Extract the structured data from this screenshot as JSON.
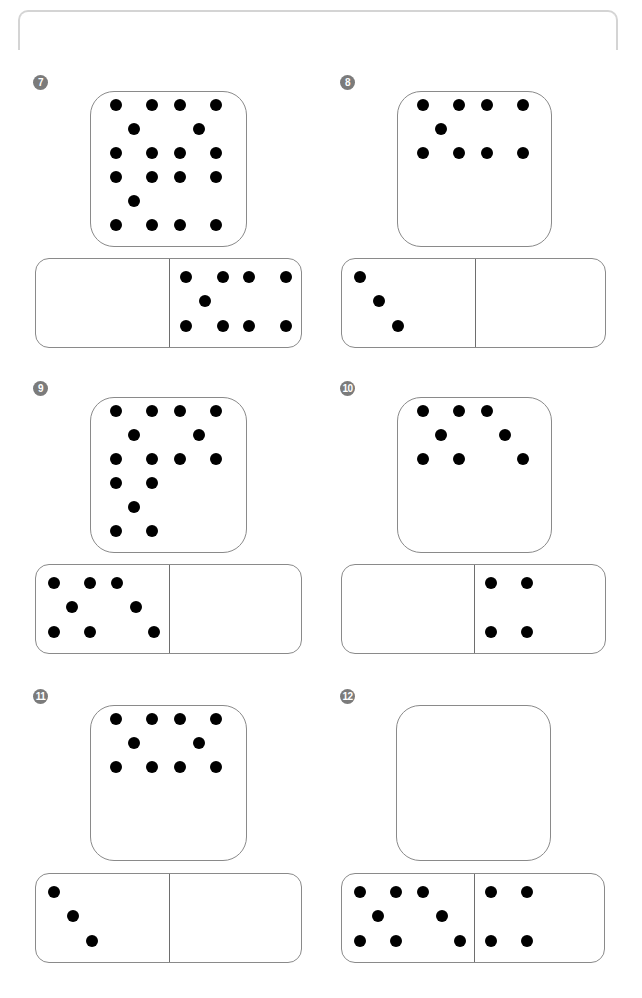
{
  "worksheet": {
    "frame_color": "#d4d4d4",
    "badge_color": "#7b7b7b",
    "dot_color": "#000000",
    "problems": [
      {
        "number": "7",
        "badge": {
          "x": 33,
          "y": 75
        },
        "square": {
          "x": 90,
          "y": 91,
          "w": 157,
          "h": 156,
          "dot_count": 19,
          "dots": [
            [
              25,
              13
            ],
            [
              61,
              13
            ],
            [
              89,
              13
            ],
            [
              125,
              13
            ],
            [
              43,
              37
            ],
            [
              108,
              37
            ],
            [
              25,
              61
            ],
            [
              61,
              61
            ],
            [
              89,
              61
            ],
            [
              125,
              61
            ],
            [
              25,
              85
            ],
            [
              61,
              85
            ],
            [
              89,
              85
            ],
            [
              125,
              85
            ],
            [
              43,
              109
            ],
            [
              25,
              133
            ],
            [
              61,
              133
            ],
            [
              89,
              133
            ],
            [
              125,
              133
            ]
          ]
        },
        "domino": {
          "x": 35,
          "y": 258,
          "w": 267,
          "h": 90,
          "divider_x": 133,
          "left_count": null,
          "right_count": 9,
          "dots": [
            [
              150,
              18
            ],
            [
              187,
              18
            ],
            [
              213,
              18
            ],
            [
              250,
              18
            ],
            [
              169,
              42
            ],
            [
              150,
              67
            ],
            [
              187,
              67
            ],
            [
              213,
              67
            ],
            [
              250,
              67
            ]
          ]
        }
      },
      {
        "number": "8",
        "badge": {
          "x": 340,
          "y": 75
        },
        "square": {
          "x": 397,
          "y": 91,
          "w": 155,
          "h": 156,
          "dot_count": 9,
          "dots": [
            [
              25,
              13
            ],
            [
              61,
              13
            ],
            [
              89,
              13
            ],
            [
              125,
              13
            ],
            [
              43,
              37
            ],
            [
              25,
              61
            ],
            [
              61,
              61
            ],
            [
              89,
              61
            ],
            [
              125,
              61
            ]
          ]
        },
        "domino": {
          "x": 341,
          "y": 258,
          "w": 265,
          "h": 90,
          "divider_x": 133,
          "left_count": 3,
          "right_count": null,
          "dots": [
            [
              18,
              18
            ],
            [
              37,
              42
            ],
            [
              56,
              67
            ]
          ]
        }
      },
      {
        "number": "9",
        "badge": {
          "x": 33,
          "y": 381
        },
        "square": {
          "x": 90,
          "y": 397,
          "w": 157,
          "h": 156,
          "dot_count": 15,
          "dots": [
            [
              25,
              13
            ],
            [
              61,
              13
            ],
            [
              89,
              13
            ],
            [
              125,
              13
            ],
            [
              43,
              37
            ],
            [
              108,
              37
            ],
            [
              25,
              61
            ],
            [
              61,
              61
            ],
            [
              89,
              61
            ],
            [
              125,
              61
            ],
            [
              25,
              85
            ],
            [
              61,
              85
            ],
            [
              43,
              109
            ],
            [
              25,
              133
            ],
            [
              61,
              133
            ]
          ]
        },
        "domino": {
          "x": 35,
          "y": 564,
          "w": 267,
          "h": 90,
          "divider_x": 133,
          "left_count": 8,
          "right_count": null,
          "dots": [
            [
              18,
              18
            ],
            [
              54,
              18
            ],
            [
              81,
              18
            ],
            [
              36,
              42
            ],
            [
              100,
              42
            ],
            [
              18,
              67
            ],
            [
              54,
              67
            ],
            [
              118,
              67
            ]
          ]
        }
      },
      {
        "number": "10",
        "badge": {
          "x": 340,
          "y": 381
        },
        "square": {
          "x": 397,
          "y": 397,
          "w": 155,
          "h": 156,
          "dot_count": 8,
          "dots": [
            [
              25,
              13
            ],
            [
              61,
              13
            ],
            [
              89,
              13
            ],
            [
              43,
              37
            ],
            [
              107,
              37
            ],
            [
              25,
              61
            ],
            [
              61,
              61
            ],
            [
              125,
              61
            ]
          ]
        },
        "domino": {
          "x": 341,
          "y": 564,
          "w": 265,
          "h": 90,
          "divider_x": 132,
          "left_count": null,
          "right_count": 4,
          "dots": [
            [
              149,
              18
            ],
            [
              185,
              18
            ],
            [
              149,
              67
            ],
            [
              185,
              67
            ]
          ]
        }
      },
      {
        "number": "11",
        "badge": {
          "x": 33,
          "y": 689
        },
        "square": {
          "x": 90,
          "y": 705,
          "w": 157,
          "h": 156,
          "dot_count": 10,
          "dots": [
            [
              25,
              13
            ],
            [
              61,
              13
            ],
            [
              89,
              13
            ],
            [
              125,
              13
            ],
            [
              43,
              37
            ],
            [
              108,
              37
            ],
            [
              25,
              61
            ],
            [
              61,
              61
            ],
            [
              89,
              61
            ],
            [
              125,
              61
            ]
          ]
        },
        "domino": {
          "x": 35,
          "y": 873,
          "w": 267,
          "h": 90,
          "divider_x": 133,
          "left_count": 3,
          "right_count": null,
          "dots": [
            [
              18,
              18
            ],
            [
              37,
              42
            ],
            [
              56,
              67
            ]
          ]
        }
      },
      {
        "number": "12",
        "badge": {
          "x": 340,
          "y": 689
        },
        "square": {
          "x": 396,
          "y": 705,
          "w": 155,
          "h": 156,
          "dot_count": null,
          "dots": []
        },
        "domino": {
          "x": 341,
          "y": 873,
          "w": 264,
          "h": 90,
          "divider_x": 132,
          "left_count": 8,
          "right_count": 4,
          "dots": [
            [
              18,
              18
            ],
            [
              54,
              18
            ],
            [
              81,
              18
            ],
            [
              36,
              42
            ],
            [
              100,
              42
            ],
            [
              18,
              67
            ],
            [
              54,
              67
            ],
            [
              118,
              67
            ],
            [
              149,
              18
            ],
            [
              185,
              18
            ],
            [
              149,
              67
            ],
            [
              185,
              67
            ]
          ]
        }
      }
    ]
  }
}
